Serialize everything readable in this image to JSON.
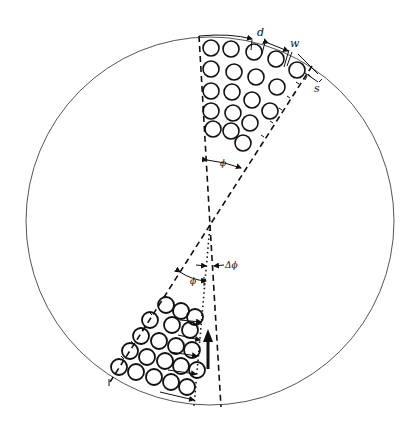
{
  "diagram": {
    "type": "schematic",
    "colors": {
      "ink": "#111111",
      "background": "#ffffff",
      "outer_circle": "#555555"
    },
    "outer_circle": {
      "cx": 210,
      "cy": 221,
      "r": 184
    },
    "labels": {
      "d": "d",
      "w": "w",
      "s": "s",
      "phi_top": "ϕ",
      "phi_bottom": "ϕ",
      "delta_phi": "Δϕ"
    },
    "top_sector": {
      "name": "upper wedge",
      "left_boundary": {
        "x1": 199,
        "y1": 36,
        "x2": 210,
        "y2": 225,
        "style": "dashed"
      },
      "right_boundary": {
        "x1": 312,
        "y1": 66,
        "x2": 210,
        "y2": 225,
        "style": "dashed"
      },
      "circle_radius": 8,
      "circles": [
        [
          211,
          48
        ],
        [
          231,
          49
        ],
        [
          254,
          52
        ],
        [
          276,
          59
        ],
        [
          297,
          70
        ],
        [
          211,
          69
        ],
        [
          234,
          72
        ],
        [
          256,
          77
        ],
        [
          277,
          87
        ],
        [
          211,
          91
        ],
        [
          232,
          92
        ],
        [
          252,
          100
        ],
        [
          270,
          111
        ],
        [
          211,
          111
        ],
        [
          233,
          113
        ],
        [
          250,
          123
        ],
        [
          213,
          129
        ],
        [
          231,
          131
        ],
        [
          243,
          143
        ]
      ]
    },
    "bottom_sector": {
      "name": "lower wedge",
      "left_boundary": {
        "x1": 210,
        "y1": 225,
        "x2": 110,
        "y2": 382,
        "style": "dashed"
      },
      "right_boundary_dotted": {
        "x1": 210,
        "y1": 225,
        "x2": 194,
        "y2": 406,
        "style": "dotted"
      },
      "right_boundary_dashed": {
        "x1": 210,
        "y1": 225,
        "x2": 221,
        "y2": 407,
        "style": "dashed"
      },
      "circle_radius": 8,
      "circles": [
        [
          166,
          305
        ],
        [
          181,
          311
        ],
        [
          195,
          317
        ],
        [
          150,
          320
        ],
        [
          172,
          325
        ],
        [
          190,
          330
        ],
        [
          141,
          336
        ],
        [
          159,
          341
        ],
        [
          176,
          346
        ],
        [
          192,
          350
        ],
        [
          130,
          351
        ],
        [
          147,
          357
        ],
        [
          165,
          361
        ],
        [
          181,
          366
        ],
        [
          197,
          370
        ],
        [
          119,
          367
        ],
        [
          136,
          372
        ],
        [
          154,
          377
        ],
        [
          171,
          382
        ],
        [
          187,
          387
        ]
      ]
    },
    "arrow": {
      "x": 208,
      "y_tail": 369,
      "y_head": 330,
      "direction": "up"
    }
  }
}
